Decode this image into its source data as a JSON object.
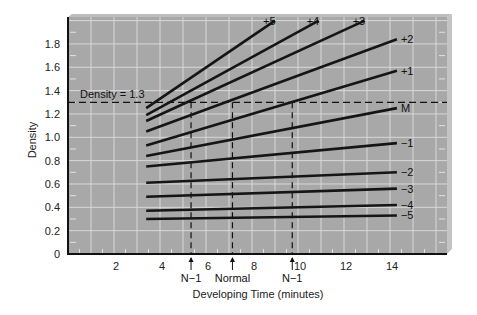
{
  "chart_data": {
    "type": "line",
    "title": "",
    "xlabel": "Developing Time (minutes)",
    "ylabel": "Density",
    "xlim": [
      0,
      16.5
    ],
    "ylim": [
      0,
      2.0
    ],
    "x_ticks": [
      2,
      4,
      6,
      8,
      10,
      12,
      14
    ],
    "y_ticks": [
      0,
      0.2,
      0.4,
      0.6,
      0.8,
      1.0,
      1.2,
      1.4,
      1.6,
      1.8
    ],
    "y_tick_labels": [
      "0",
      "0.2",
      "0.4",
      "0.6",
      "0.8",
      "1.0",
      "1.2",
      "1.4",
      "1.6",
      "1.8"
    ],
    "grid": true,
    "legend": "inline labels at line ends",
    "series": [
      {
        "name": "+5",
        "x": [
          3.4,
          9.0
        ],
        "y": [
          1.25,
          2.0
        ]
      },
      {
        "name": "+4",
        "x": [
          3.4,
          10.9
        ],
        "y": [
          1.19,
          2.0
        ]
      },
      {
        "name": "+3",
        "x": [
          3.4,
          12.9
        ],
        "y": [
          1.14,
          2.0
        ]
      },
      {
        "name": "+2",
        "x": [
          3.4,
          14.3
        ],
        "y": [
          1.05,
          1.84
        ]
      },
      {
        "name": "+1",
        "x": [
          3.4,
          14.3
        ],
        "y": [
          0.93,
          1.57
        ]
      },
      {
        "name": "M",
        "x": [
          3.4,
          14.3
        ],
        "y": [
          0.84,
          1.25
        ]
      },
      {
        "name": "−1",
        "x": [
          3.4,
          14.3
        ],
        "y": [
          0.75,
          0.95
        ]
      },
      {
        "name": "−2",
        "x": [
          3.4,
          14.3
        ],
        "y": [
          0.61,
          0.7
        ]
      },
      {
        "name": "−3",
        "x": [
          3.4,
          14.3
        ],
        "y": [
          0.49,
          0.56
        ]
      },
      {
        "name": "−4",
        "x": [
          3.4,
          14.3
        ],
        "y": [
          0.37,
          0.42
        ]
      },
      {
        "name": "−5",
        "x": [
          3.4,
          14.3
        ],
        "y": [
          0.3,
          0.33
        ]
      }
    ],
    "annotations": {
      "reference_line": {
        "label": "Density = 1.3",
        "y": 1.3
      },
      "markers": [
        {
          "label": "N−1",
          "x": 5.35
        },
        {
          "label": "Normal",
          "x": 7.15
        },
        {
          "label": "N−1",
          "x": 9.75
        }
      ]
    }
  },
  "colors": {
    "plot_background": "#a8a8a8",
    "grid": "#d8d8d8",
    "line": "#151515",
    "bevel": "#c4c4c4"
  }
}
